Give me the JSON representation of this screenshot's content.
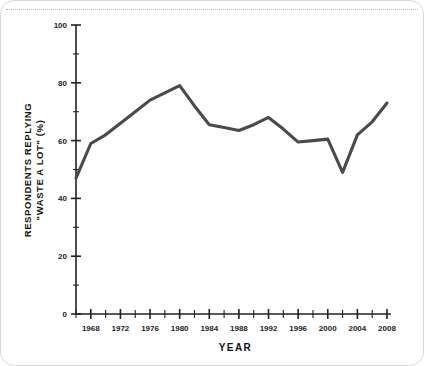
{
  "figure": {
    "background_color": "#ffffff",
    "frame_color": "#d8d8d8",
    "top_rule_style": "dotted"
  },
  "chart_data": {
    "type": "line",
    "title": "",
    "subtitle": "",
    "xlabel": "YEAR",
    "ylabel": "RESPONDENTS REPLYING \"WASTE A LOT\" (%)",
    "ylabel_line1": "RESPONDENTS REPLYING",
    "ylabel_line2": "\"WASTE A LOT\" (%)",
    "xlim": [
      1966,
      2008
    ],
    "ylim": [
      0,
      100
    ],
    "grid": false,
    "legend": false,
    "legend_position": "none",
    "line_color": "#4a4a4a",
    "line_width": 3.1,
    "y_ticks_major": [
      0,
      20,
      40,
      60,
      80,
      100
    ],
    "y_tick_labels": [
      "0",
      "20",
      "40",
      "60",
      "80",
      "100"
    ],
    "y_ticks_minor": [
      10,
      30,
      50,
      70,
      90
    ],
    "x_ticks_labeled": [
      1968,
      1972,
      1976,
      1980,
      1984,
      1988,
      1992,
      1996,
      2000,
      2004,
      2008
    ],
    "x_tick_labels": [
      "1968",
      "1972",
      "1976",
      "1980",
      "1984",
      "1988",
      "1992",
      "1996",
      "2000",
      "2004",
      "2008"
    ],
    "x_ticks_unlabeled": [
      1966,
      1970,
      1974,
      1978,
      1982,
      1986,
      1990,
      1994,
      1998,
      2002,
      2006
    ],
    "x": [
      1966,
      1968,
      1970,
      1972,
      1974,
      1976,
      1978,
      1980,
      1982,
      1984,
      1986,
      1988,
      1990,
      1992,
      1994,
      1996,
      1998,
      2000,
      2002,
      2004,
      2006,
      2008
    ],
    "values": [
      47,
      59,
      62,
      66,
      70,
      74,
      76.5,
      79,
      72,
      65.5,
      64.5,
      63.5,
      65.5,
      68,
      64,
      59.5,
      60,
      60.5,
      49,
      62,
      66.5,
      73
    ],
    "series": [
      {
        "name": "Respondents replying \"waste a lot\"",
        "values": [
          47,
          59,
          62,
          66,
          70,
          74,
          76.5,
          79,
          72,
          65.5,
          64.5,
          63.5,
          65.5,
          68,
          64,
          59.5,
          60,
          60.5,
          49,
          62,
          66.5,
          73
        ]
      }
    ]
  }
}
